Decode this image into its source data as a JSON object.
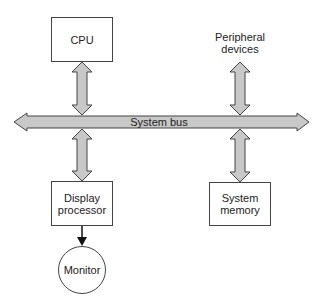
{
  "diagram": {
    "nodes": {
      "cpu": {
        "label": "CPU"
      },
      "peripheral": {
        "line1": "Peripheral",
        "line2": "devices"
      },
      "bus": {
        "label": "System bus"
      },
      "display": {
        "line1": "Display",
        "line2": "processor"
      },
      "memory": {
        "line1": "System",
        "line2": "memory"
      },
      "monitor": {
        "label": "Monitor"
      }
    },
    "edges": [
      {
        "from": "cpu",
        "to": "bus",
        "type": "bidirectional"
      },
      {
        "from": "peripheral",
        "to": "bus",
        "type": "bidirectional"
      },
      {
        "from": "bus",
        "to": "display",
        "type": "bidirectional"
      },
      {
        "from": "bus",
        "to": "memory",
        "type": "bidirectional"
      },
      {
        "from": "display",
        "to": "monitor",
        "type": "directed"
      }
    ],
    "colors": {
      "arrow_fill": "#c8c8c8",
      "stroke": "#444444"
    }
  }
}
